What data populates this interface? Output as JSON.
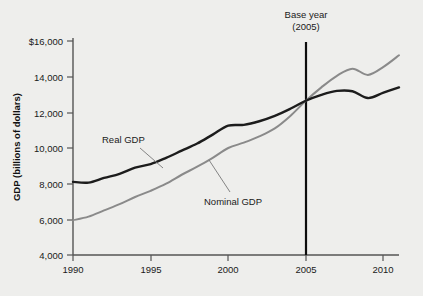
{
  "chart_data": {
    "type": "line",
    "title": "",
    "xlabel": "",
    "ylabel": "GDP (billions of dollars)",
    "xlim": [
      1990,
      2011
    ],
    "ylim": [
      4000,
      16000
    ],
    "grid": false,
    "legend_position": "inline-labels",
    "x_ticks": [
      "1990",
      "1995",
      "2000",
      "2005",
      "2010"
    ],
    "x_tick_values": [
      1990,
      1995,
      2000,
      2005,
      2010
    ],
    "y_ticks": [
      "4,000",
      "6,000",
      "8,000",
      "10,000",
      "12,000",
      "14,000",
      "$16,000"
    ],
    "y_tick_values": [
      4000,
      6000,
      8000,
      10000,
      12000,
      14000,
      16000
    ],
    "x": [
      1990,
      1991,
      1992,
      1993,
      1994,
      1995,
      1996,
      1997,
      1998,
      1999,
      2000,
      2001,
      2002,
      2003,
      2004,
      2005,
      2006,
      2007,
      2008,
      2009,
      2010,
      2011
    ],
    "series": [
      {
        "name": "Real GDP",
        "color": "#1c1c1c",
        "values": [
          8100,
          8060,
          8320,
          8550,
          8900,
          9100,
          9450,
          9850,
          10250,
          10750,
          11250,
          11300,
          11500,
          11800,
          12200,
          12650,
          12980,
          13200,
          13180,
          12800,
          13100,
          13400
        ]
      },
      {
        "name": "Nominal GDP",
        "color": "#8a8a8a",
        "values": [
          5950,
          6150,
          6500,
          6850,
          7250,
          7600,
          8000,
          8500,
          8950,
          9450,
          10000,
          10300,
          10650,
          11100,
          11800,
          12650,
          13400,
          14050,
          14450,
          14100,
          14550,
          15200
        ]
      }
    ],
    "annotations": [
      {
        "name": "base-year",
        "line1": "Base year",
        "line2": "(2005)",
        "x_value": 2005,
        "type": "vertical-marker"
      },
      {
        "name": "real-gdp-callout",
        "text": "Real GDP",
        "points_to_series": "Real GDP"
      },
      {
        "name": "nominal-gdp-callout",
        "text": "Nominal GDP",
        "points_to_series": "Nominal GDP"
      }
    ]
  },
  "figure": {
    "background_color": "#eeeeec",
    "axis_color": "#555555"
  }
}
